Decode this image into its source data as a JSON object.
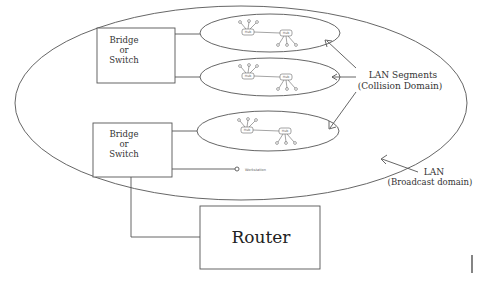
{
  "diagram": {
    "title": "",
    "colors": {
      "stroke": "#555555",
      "background": "#ffffff",
      "text": "#333333"
    },
    "broadcast_domain": {
      "label_line1": "LAN",
      "label_line2": "(Broadcast domain)"
    },
    "collision_domain": {
      "label_line1": "LAN Segments",
      "label_line2": "(Collision Domain)"
    },
    "bridges": [
      {
        "line1": "Bridge",
        "line2": "or",
        "line3": "Switch"
      },
      {
        "line1": "Bridge",
        "line2": "or",
        "line3": "Switch"
      }
    ],
    "segments": [
      {
        "hub_a": "Hub",
        "hub_b": "Hub"
      },
      {
        "hub_a": "Hub",
        "hub_b": "Hub"
      },
      {
        "hub_a": "Hub",
        "hub_b": "Hub"
      }
    ],
    "workstation": {
      "label": "Workstation"
    },
    "router": {
      "label": "Router"
    }
  }
}
